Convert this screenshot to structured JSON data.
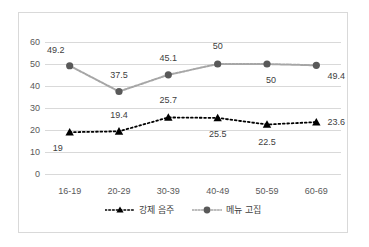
{
  "chart_data": {
    "type": "line",
    "title": "",
    "subtitle": "",
    "xlabel": "",
    "ylabel": "",
    "categories": [
      "16-19",
      "20-29",
      "30-39",
      "40-49",
      "50-59",
      "60-69"
    ],
    "ylim": [
      0,
      60
    ],
    "yticks": [
      0,
      10,
      20,
      30,
      40,
      50,
      60
    ],
    "ytick_labels": [
      "0",
      "10",
      "20",
      "30",
      "40",
      "50",
      "60"
    ],
    "grid": true,
    "legend_position": "bottom",
    "series": [
      {
        "name": "강제 음주",
        "marker": "triangle",
        "linestyle": "dotted",
        "color": "#000000",
        "values": [
          19,
          19.4,
          25.7,
          25.5,
          22.5,
          23.6
        ],
        "data_labels": [
          "19",
          "19.4",
          "25.7",
          "25.5",
          "22.5",
          "23.6"
        ]
      },
      {
        "name": "메뉴 고집",
        "marker": "circle",
        "linestyle": "solid",
        "color": "#595959",
        "values": [
          49.2,
          37.5,
          45.1,
          50,
          50,
          49.4
        ],
        "data_labels": [
          "49.2",
          "37.5",
          "45.1",
          "50",
          "50",
          "49.4"
        ]
      }
    ]
  },
  "colors": {
    "series_forced_drinking": "#000000",
    "series_menu_insistence": "#595959",
    "gridline": "#d9d9d9",
    "frame_border": "#d9d9d9",
    "tick_text": "#595959",
    "label_text": "#404040"
  }
}
